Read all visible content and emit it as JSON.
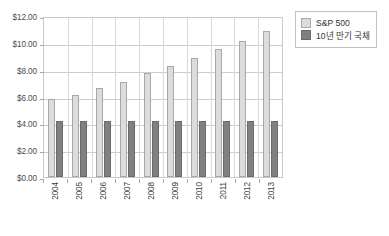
{
  "chart_data": {
    "type": "bar",
    "title": "",
    "xlabel": "",
    "ylabel": "",
    "categories": [
      "2004",
      "2005",
      "2006",
      "2007",
      "2008",
      "2009",
      "2010",
      "2011",
      "2012",
      "2013"
    ],
    "series": [
      {
        "name": "S&P 500",
        "color": "#DCDCDC",
        "values": [
          5.8,
          6.15,
          6.65,
          7.1,
          7.75,
          8.25,
          8.85,
          9.55,
          10.15,
          10.85
        ]
      },
      {
        "name": "10년 만기 국채",
        "color": "#808080",
        "values": [
          4.15,
          4.15,
          4.15,
          4.15,
          4.15,
          4.15,
          4.15,
          4.15,
          4.15,
          4.15
        ]
      }
    ],
    "ylim": [
      0,
      12
    ],
    "ytick_values": [
      0,
      2,
      4,
      6,
      8,
      10,
      12
    ],
    "ytick_labels": [
      "$0.00",
      "$2.00",
      "$4.00",
      "$6.00",
      "$8.00",
      "$10.00",
      "$12.00"
    ],
    "grid": true,
    "legend_position": "top-right"
  },
  "legend": {
    "entries": [
      {
        "label": "S&P 500"
      },
      {
        "label": "10년 만기 국채"
      }
    ]
  }
}
